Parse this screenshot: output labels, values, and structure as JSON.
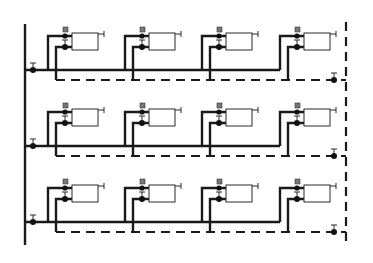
{
  "diagram": {
    "colors": {
      "line": "#1a1a1a",
      "background": "#ffffff",
      "radiator_fill": "#ffffff"
    },
    "riser": {
      "x": 25,
      "y_top": 24,
      "y_bottom": 245
    },
    "return_riser": {
      "x": 346,
      "y_top": 22,
      "y_bottom": 246
    },
    "floors": [
      {
        "id": 1,
        "supply_y": 70,
        "return_y": 80,
        "radiator_top": 33
      },
      {
        "id": 2,
        "supply_y": 146,
        "return_y": 156,
        "radiator_top": 109
      },
      {
        "id": 3,
        "supply_y": 222,
        "return_y": 232,
        "radiator_top": 185
      }
    ],
    "radiator_columns_x": [
      48,
      125,
      202,
      280
    ],
    "radiators_per_floor": 4,
    "legend": {
      "supply": "solid line",
      "return": "dashed line",
      "radiator": "rectangle",
      "valve": "filled dot with T handle"
    }
  }
}
